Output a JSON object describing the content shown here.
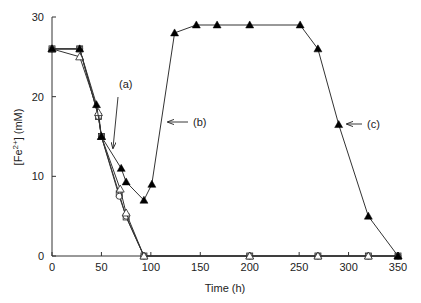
{
  "chart_data": {
    "type": "line",
    "title": "",
    "xlabel": "Time (h)",
    "ylabel": "[Fe2+] (mM)",
    "ylabel_parts": {
      "pre": "[Fe",
      "sup": "2+",
      "post": "] (mM)"
    },
    "xlim": [
      0,
      350
    ],
    "ylim": [
      0,
      30
    ],
    "xticks": [
      0,
      50,
      100,
      150,
      200,
      250,
      300,
      350
    ],
    "yticks": [
      0,
      10,
      20,
      30
    ],
    "grid": false,
    "legend": null,
    "series": [
      {
        "name": "filled-triangle",
        "marker": "filled-triangle",
        "x": [
          0,
          28,
          45,
          50,
          70,
          75,
          93,
          101,
          124,
          146,
          167,
          200,
          251,
          269,
          290,
          320,
          350
        ],
        "y": [
          26,
          26,
          19,
          15,
          11,
          9.3,
          7,
          9,
          28,
          29,
          29,
          29,
          29,
          26,
          16.5,
          5,
          0
        ]
      },
      {
        "name": "open-triangle",
        "marker": "open-triangle",
        "x": [
          0,
          28,
          47,
          50,
          69,
          75,
          93,
          200,
          269,
          320,
          350
        ],
        "y": [
          26,
          25,
          18,
          15,
          8.4,
          5.4,
          0,
          0,
          0,
          0,
          0
        ]
      },
      {
        "name": "open-circle",
        "marker": "open-circle",
        "x": [
          0,
          28,
          47,
          50,
          68,
          75,
          93,
          200,
          269,
          320,
          350
        ],
        "y": [
          26,
          26,
          17.5,
          15,
          7.5,
          5,
          0,
          0,
          0,
          0,
          0
        ]
      },
      {
        "name": "open-square",
        "marker": "open-square",
        "x": [
          0,
          28,
          47,
          50,
          68,
          75,
          93,
          200,
          269,
          320,
          350
        ],
        "y": [
          26,
          26,
          17.5,
          15,
          7.8,
          4.9,
          0,
          0,
          0,
          0,
          0
        ]
      }
    ],
    "annotations": [
      {
        "label": "(a)",
        "text_x": 119,
        "text_y": 88,
        "arrow": [
          118,
          97,
          113,
          148
        ]
      },
      {
        "label": "(b)",
        "text_x": 193,
        "text_y": 126,
        "arrow": [
          188,
          122,
          168,
          122
        ]
      },
      {
        "label": "(c)",
        "text_x": 367,
        "text_y": 128,
        "arrow": [
          362,
          124,
          347,
          124
        ]
      }
    ]
  }
}
